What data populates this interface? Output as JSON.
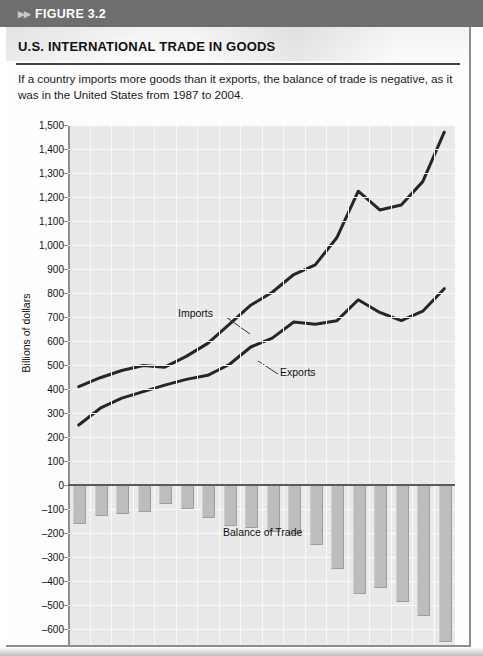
{
  "header": {
    "arrows_icon": "double-chevron-right-icon",
    "figure_label": "FIGURE 3.2"
  },
  "figure": {
    "title": "U.S. INTERNATIONAL TRADE IN GOODS",
    "caption": "If a country imports more goods than it exports, the balance of trade is negative, as it was in the United States from 1987 to 2004."
  },
  "colors": {
    "band": "#6e6e6e",
    "plot_background": "#e9e9e9",
    "gridline": "#fafafa",
    "line": "#262626",
    "bar": "#bdbdbd",
    "zero_line": "#5a5a5a"
  },
  "chart_data": {
    "type": "line",
    "title": "U.S. INTERNATIONAL TRADE IN GOODS",
    "subtitle": "If a country imports more goods than it exports, the balance of trade is negative, as it was in the United States from 1987 to 2004.",
    "xlabel": "",
    "ylabel": "Billions of dollars",
    "ylim": [
      -700,
      1500
    ],
    "ytick_values": [
      1500,
      1400,
      1300,
      1200,
      1100,
      1000,
      900,
      800,
      700,
      600,
      500,
      400,
      300,
      200,
      100,
      0,
      -100,
      -200,
      -300,
      -400,
      -500,
      -600,
      -700
    ],
    "ytick_labels": [
      "1,500",
      "1,400",
      "1,300",
      "1,200",
      "1,100",
      "1,000",
      "900",
      "800",
      "700",
      "600",
      "500",
      "400",
      "300",
      "200",
      "100",
      "0",
      "–100",
      "–200",
      "–300",
      "–400",
      "–500",
      "–600",
      "–700"
    ],
    "grid": true,
    "legend_position": "inline-annotations",
    "x": [
      1987,
      1988,
      1989,
      1990,
      1991,
      1992,
      1993,
      1994,
      1995,
      1996,
      1997,
      1998,
      1999,
      2000,
      2001,
      2002,
      2003,
      2004
    ],
    "categories": [
      "1987",
      "'88",
      "'89",
      "'90",
      "'91",
      "'92",
      "'93",
      "'94",
      "'95",
      "'96",
      "'97",
      "'98",
      "'99",
      "2000",
      "'01",
      "'02",
      "'03",
      "'04"
    ],
    "series": [
      {
        "name": "Imports",
        "type": "line",
        "values": [
          410,
          447,
          477,
          498,
          491,
          536,
          590,
          669,
          749,
          803,
          877,
          917,
          1030,
          1224,
          1146,
          1167,
          1264,
          1470
        ]
      },
      {
        "name": "Exports",
        "type": "line",
        "values": [
          250,
          320,
          362,
          389,
          416,
          440,
          457,
          502,
          575,
          612,
          679,
          670,
          684,
          772,
          719,
          685,
          724,
          818
        ]
      },
      {
        "name": "Balance of Trade",
        "type": "bar",
        "values": [
          -160,
          -127,
          -115,
          -109,
          -75,
          -96,
          -133,
          -167,
          -174,
          -191,
          -198,
          -247,
          -346,
          -452,
          -427,
          -482,
          -540,
          -652
        ]
      }
    ],
    "annotations": [
      {
        "text": "Imports",
        "series": "Imports"
      },
      {
        "text": "Exports",
        "series": "Exports"
      },
      {
        "text": "Balance of Trade",
        "series": "Balance of Trade"
      }
    ]
  }
}
